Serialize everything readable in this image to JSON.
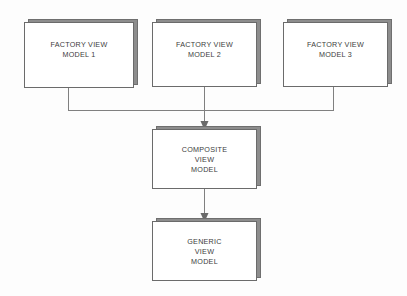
{
  "diagram": {
    "background_color": "#fdfdfd",
    "box_fill_color": "#ffffff",
    "box_border_color": "#6b6b6b",
    "box_shadow_color": "#8d8d8d",
    "connector_color": "#808080",
    "text_color": "#3c3c3c"
  },
  "nodes": [
    {
      "id": "factory-view-model-1",
      "lines": [
        "FACTORY VIEW",
        "MODEL 1"
      ]
    },
    {
      "id": "factory-view-model-2",
      "lines": [
        "FACTORY VIEW",
        "MODEL 2"
      ]
    },
    {
      "id": "factory-view-model-3",
      "lines": [
        "FACTORY VIEW",
        "MODEL 3"
      ]
    },
    {
      "id": "composite-view-model",
      "lines": [
        "COMPOSITE",
        "VIEW",
        "MODEL"
      ]
    },
    {
      "id": "generic-view-model",
      "lines": [
        "GENERIC",
        "VIEW",
        "MODEL"
      ]
    }
  ],
  "connectors": [
    {
      "id": "factory-1-to-composite",
      "from": "factory-view-model-1",
      "to": "composite-view-model",
      "arrowhead": false
    },
    {
      "id": "factory-2-to-composite",
      "from": "factory-view-model-2",
      "to": "composite-view-model",
      "arrowhead": true
    },
    {
      "id": "factory-3-to-composite",
      "from": "factory-view-model-3",
      "to": "composite-view-model",
      "arrowhead": false
    },
    {
      "id": "composite-to-generic",
      "from": "composite-view-model",
      "to": "generic-view-model",
      "arrowhead": true
    }
  ]
}
